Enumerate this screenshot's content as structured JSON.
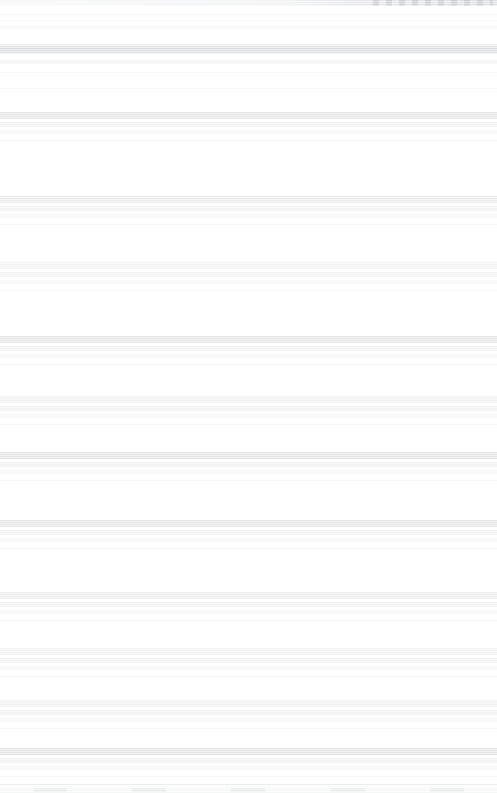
{
  "meta": {
    "width": 497,
    "height": 793,
    "orientation": "portrait",
    "legibility": "none",
    "note": "Source screenshot is horizontally smeared; no text or glyph detail is recoverable. All text values are empty because nothing is readable in the pixels."
  },
  "colors": {
    "background": "#ffffff",
    "band_dark": "#c2c5c9",
    "band_mid": "#d3d6d9",
    "band_light": "#dfe1e3",
    "divider": "#e6e8ea",
    "statusbar_right": "#d2d6da"
  },
  "statusbar": {
    "present": true,
    "height_px": 6,
    "indicator_cluster_side": "right",
    "indicator_count": 5,
    "text": ""
  },
  "header": {
    "present": true,
    "top_px": 44,
    "title": "",
    "subtitle": ""
  },
  "list": {
    "present": true,
    "kind": "scrolling-feed",
    "row_count": 11,
    "rows": [
      {
        "top": 112,
        "primary": "",
        "secondary": "",
        "tertiary": "",
        "weight": "heavy"
      },
      {
        "top": 196,
        "primary": "",
        "secondary": "",
        "tertiary": "",
        "weight": "medium"
      },
      {
        "top": 262,
        "primary": "",
        "secondary": "",
        "tertiary": "",
        "weight": "light"
      },
      {
        "top": 336,
        "primary": "",
        "secondary": "",
        "tertiary": "",
        "weight": "heavy"
      },
      {
        "top": 396,
        "primary": "",
        "secondary": "",
        "tertiary": "",
        "weight": "light"
      },
      {
        "top": 452,
        "primary": "",
        "secondary": "",
        "tertiary": "",
        "weight": "heavy"
      },
      {
        "top": 520,
        "primary": "",
        "secondary": "",
        "tertiary": "",
        "weight": "heavy"
      },
      {
        "top": 592,
        "primary": "",
        "secondary": "",
        "tertiary": "",
        "weight": "medium"
      },
      {
        "top": 648,
        "primary": "",
        "secondary": "",
        "tertiary": "",
        "weight": "light"
      },
      {
        "top": 700,
        "primary": "",
        "secondary": "",
        "tertiary": "",
        "weight": "light"
      },
      {
        "top": 748,
        "primary": "",
        "secondary": "",
        "tertiary": "",
        "weight": "heavy"
      }
    ]
  },
  "bottomnav": {
    "present": true,
    "height_px": 8,
    "tab_count": 5,
    "tabs": [
      {
        "label": "",
        "icon": "unreadable-icon"
      },
      {
        "label": "",
        "icon": "unreadable-icon"
      },
      {
        "label": "",
        "icon": "unreadable-icon"
      },
      {
        "label": "",
        "icon": "unreadable-icon"
      },
      {
        "label": "",
        "icon": "unreadable-icon"
      }
    ]
  }
}
